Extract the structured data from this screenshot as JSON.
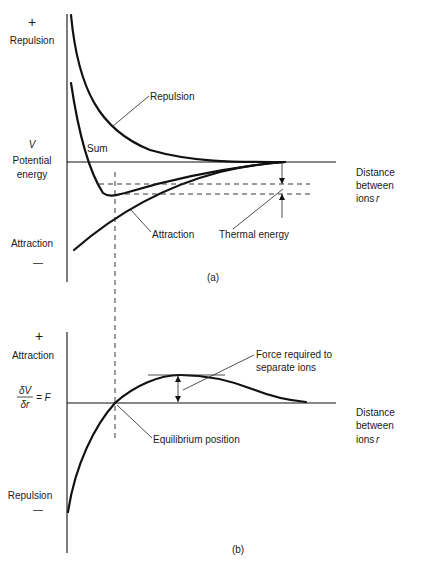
{
  "figure_a": {
    "y_plus": "+",
    "y_top_label": "Repulsion",
    "y_symbol": "V",
    "y_label_line1": "Potential",
    "y_label_line2": "energy",
    "y_bottom_label": "Attraction",
    "y_minus": "—",
    "x_label_line1": "Distance",
    "x_label_line2": "between",
    "x_label_line3": "ions",
    "x_symbol": "r",
    "curve_labels": {
      "repulsion": "Repulsion",
      "sum": "Sum",
      "attraction": "Attraction",
      "thermal": "Thermal energy"
    },
    "caption": "(a)"
  },
  "figure_b": {
    "y_plus": "+",
    "y_top_label": "Attraction",
    "y_num": "δV",
    "y_den": "δr",
    "y_eq": "= F",
    "y_bottom_label": "Repulsion",
    "y_minus": "—",
    "x_label_line1": "Distance",
    "x_label_line2": "between",
    "x_label_line3": "ions",
    "x_symbol": "r",
    "annotations": {
      "force_line1": "Force required to",
      "force_line2": "separate ions",
      "equilibrium": "Equilibrium position"
    },
    "caption": "(b)"
  },
  "colors": {
    "ink": "#111111",
    "background": "#ffffff"
  }
}
